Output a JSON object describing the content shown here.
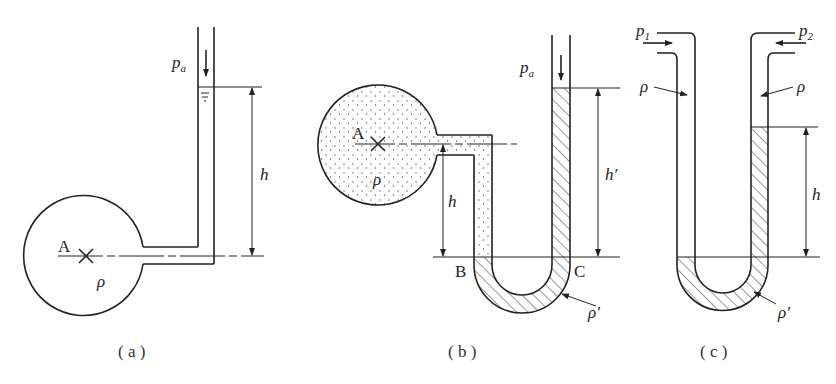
{
  "figure": {
    "panels": [
      {
        "id": "a",
        "caption": "( a )",
        "labels": {
          "point": "A",
          "pressure": "p",
          "pressure_sub": "a",
          "density": "ρ",
          "height": "h"
        },
        "description": "Piezometer tube connected to vessel at point A; liquid rises height h above A, open to atmosphere pa"
      },
      {
        "id": "b",
        "caption": "( b )",
        "labels": {
          "point": "A",
          "pressure": "p",
          "pressure_sub": "a",
          "density": "ρ",
          "height": "h",
          "height2": "h′",
          "left_point": "B",
          "right_point": "C",
          "manometer_density": "ρ′"
        },
        "description": "U-tube manometer with vessel fluid ρ (dotted) and manometer liquid ρ′ (hatched); B and C at same level"
      },
      {
        "id": "c",
        "caption": "( c )",
        "labels": {
          "p_left": "p",
          "p_left_sub": "1",
          "p_right": "p",
          "p_right_sub": "2",
          "density_left": "ρ",
          "density_right": "ρ",
          "height": "h",
          "manometer_density": "ρ′"
        },
        "description": "Differential U-tube manometer between p1 and p2 with manometer liquid ρ′ showing height difference h"
      }
    ]
  }
}
